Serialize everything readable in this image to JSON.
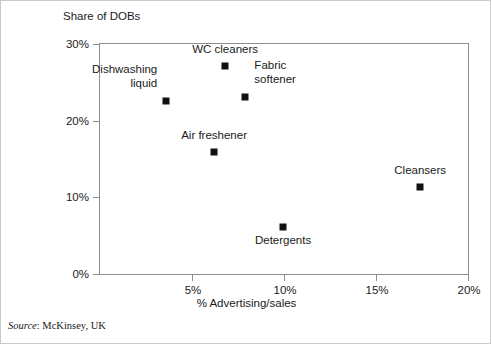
{
  "chart_data": {
    "type": "scatter",
    "title": "",
    "xlabel": "% Advertising/sales",
    "ylabel": "Share of DOBs",
    "xlim": [
      0,
      20
    ],
    "ylim": [
      0,
      30
    ],
    "grid": false,
    "legend": "none",
    "x_ticks": [
      {
        "value": 5,
        "label": "5%"
      },
      {
        "value": 10,
        "label": "10%"
      },
      {
        "value": 15,
        "label": "15%"
      },
      {
        "value": 20,
        "label": "20%"
      }
    ],
    "y_ticks": [
      {
        "value": 0,
        "label": "0%"
      },
      {
        "value": 10,
        "label": "10%"
      },
      {
        "value": 20,
        "label": "20%"
      },
      {
        "value": 30,
        "label": "30%"
      }
    ],
    "marker_color": "#111111",
    "frame_color": "#8d8d8d",
    "points": [
      {
        "name": "WC cleaners",
        "label": "WC cleaners",
        "x": 6.8,
        "y": 27.1,
        "label_anchor": "center",
        "label_dx": 0,
        "label_dy": -17
      },
      {
        "name": "Dishwashing liquid",
        "label": "Dishwashing\nliquid",
        "x": 3.6,
        "y": 22.6,
        "label_anchor": "left",
        "label_dx": -9,
        "label_dy": -18
      },
      {
        "name": "Fabric softener",
        "label": "Fabric\nsoftener",
        "x": 7.9,
        "y": 23.1,
        "label_anchor": "right",
        "label_dx": 9,
        "label_dy": -18
      },
      {
        "name": "Air freshener",
        "label": "Air freshener",
        "x": 6.2,
        "y": 15.9,
        "label_anchor": "center",
        "label_dx": 0,
        "label_dy": -17
      },
      {
        "name": "Cleansers",
        "label": "Cleansers",
        "x": 17.4,
        "y": 11.3,
        "label_anchor": "center",
        "label_dx": 0,
        "label_dy": -17
      },
      {
        "name": "Detergents",
        "label": "Detergents",
        "x": 9.95,
        "y": 6.1,
        "label_anchor": "center",
        "label_dx": 0,
        "label_dy": 6
      }
    ]
  },
  "figure": {
    "y_axis_title": "Share of DOBs",
    "x_axis_title": "% Advertising/sales",
    "source_word": "Source",
    "source_rest": ": McKinsey, UK"
  }
}
